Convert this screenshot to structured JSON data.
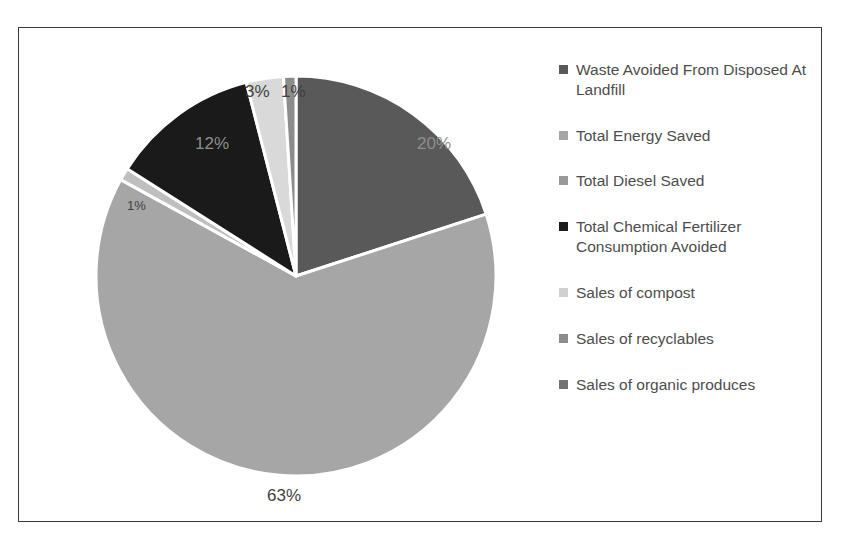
{
  "chart_data": {
    "type": "pie",
    "title": "",
    "legend_position": "right",
    "categories": [
      "Waste Avoided From Disposed At Landfill",
      "Total Energy Saved",
      "Total Diesel Saved",
      "Total Chemical Fertilizer Consumption Avoided",
      "Sales of compost",
      "Sales of recyclables",
      "Sales of organic produces"
    ],
    "values": [
      20,
      63,
      1,
      12,
      3,
      1,
      0
    ],
    "value_labels": [
      "20%",
      "63%",
      "1%",
      "12%",
      "3%",
      "1%",
      ""
    ],
    "colors": [
      "#595959",
      "#a6a6a6",
      "#bfbfbf",
      "#1a1a1a",
      "#d9d9d9",
      "#8c8c8c",
      "#737373"
    ],
    "units": "percent"
  },
  "frame": {
    "border_color": "#3a3a3a",
    "background": "#ffffff"
  },
  "pie": {
    "center_x": 277,
    "center_y": 248,
    "radius": 200,
    "slices": [
      {
        "name": "waste-avoided-from-disposed-at-landfill",
        "label": "20%",
        "percent": 20,
        "color": "#595959",
        "start_deg": 0,
        "sweep_deg": 72.0,
        "label_x": 398,
        "label_y": 106,
        "label_class": "on-dark"
      },
      {
        "name": "total-energy-saved",
        "label": "63%",
        "percent": 63,
        "color": "#a6a6a6",
        "start_deg": 72.0,
        "sweep_deg": 226.8,
        "label_x": 248,
        "label_y": 458,
        "label_class": "on-mid"
      },
      {
        "name": "total-diesel-saved",
        "label": "1%",
        "percent": 1,
        "color": "#bfbfbf",
        "start_deg": 298.8,
        "sweep_deg": 3.6,
        "label_x": 108,
        "label_y": 170,
        "label_class": "on-mid tiny"
      },
      {
        "name": "total-chemical-fertilizer-consumption-avoided",
        "label": "12%",
        "percent": 12,
        "color": "#1a1a1a",
        "start_deg": 302.4,
        "sweep_deg": 43.2,
        "label_x": 176,
        "label_y": 106,
        "label_class": "on-dark"
      },
      {
        "name": "sales-of-compost",
        "label": "3%",
        "percent": 3,
        "color": "#d9d9d9",
        "start_deg": 345.6,
        "sweep_deg": 10.8,
        "label_x": 226,
        "label_y": 54,
        "label_class": "on-mid"
      },
      {
        "name": "sales-of-recyclables",
        "label": "1%",
        "percent": 1,
        "color": "#8c8c8c",
        "start_deg": 356.4,
        "sweep_deg": 3.6,
        "label_x": 262,
        "label_y": 54,
        "label_class": "on-mid"
      },
      {
        "name": "sales-of-organic-produces",
        "label": "",
        "percent": 0,
        "color": "#737373",
        "start_deg": 360.0,
        "sweep_deg": 0.0,
        "label_x": 0,
        "label_y": 0,
        "label_class": ""
      }
    ],
    "separator_color": "#ffffff"
  },
  "legend": {
    "items": [
      {
        "label": "Waste Avoided From Disposed At Landfill",
        "color": "#595959",
        "name": "legend-item-waste-avoided"
      },
      {
        "label": "Total Energy Saved",
        "color": "#a6a6a6",
        "name": "legend-item-total-energy-saved"
      },
      {
        "label": "Total Diesel Saved",
        "color": "#999999",
        "name": "legend-item-total-diesel-saved"
      },
      {
        "label": "Total Chemical Fertilizer Consumption Avoided",
        "color": "#1a1a1a",
        "name": "legend-item-total-chemical-fertilizer"
      },
      {
        "label": "Sales of compost",
        "color": "#d0d0d0",
        "name": "legend-item-sales-of-compost"
      },
      {
        "label": "Sales of recyclables",
        "color": "#8c8c8c",
        "name": "legend-item-sales-of-recyclables"
      },
      {
        "label": "Sales of organic produces",
        "color": "#737373",
        "name": "legend-item-sales-of-organic-produces"
      }
    ]
  }
}
